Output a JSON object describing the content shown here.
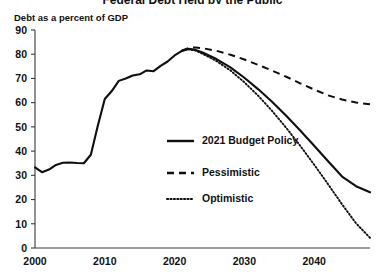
{
  "chart_data": {
    "type": "line",
    "title": "Federal Debt Held by the Public",
    "ylabel": "Debt as a percent of GDP",
    "xlabel": "",
    "xlim": [
      2000,
      2048
    ],
    "ylim": [
      0,
      90
    ],
    "yticks": [
      0,
      10,
      20,
      30,
      40,
      50,
      60,
      70,
      80,
      90
    ],
    "xticks": [
      2000,
      2010,
      2020,
      2030,
      2040
    ],
    "grid": false,
    "legend_position": "center",
    "series": [
      {
        "name": "2021 Budget Policy",
        "style": "solid",
        "x": [
          2000,
          2001,
          2002,
          2003,
          2004,
          2005,
          2006,
          2007,
          2008,
          2009,
          2010,
          2011,
          2012,
          2013,
          2014,
          2015,
          2016,
          2017,
          2018,
          2019,
          2020,
          2021,
          2022,
          2023,
          2024,
          2026,
          2028,
          2030,
          2032,
          2034,
          2036,
          2038,
          2040,
          2042,
          2044,
          2046,
          2048
        ],
        "values": [
          33.3,
          31.3,
          32.4,
          34.3,
          35.2,
          35.3,
          35.1,
          35.0,
          38.5,
          50.5,
          61.5,
          64.8,
          69.0,
          70.0,
          71.2,
          71.7,
          73.3,
          73.0,
          75.2,
          77.0,
          79.5,
          81.3,
          82.2,
          81.8,
          80.7,
          78.0,
          74.6,
          70.3,
          65.5,
          60.3,
          54.6,
          48.5,
          42.2,
          35.8,
          29.5,
          25.5,
          23.0
        ]
      },
      {
        "name": "Pessimistic",
        "style": "dashed",
        "x": [
          2021,
          2022,
          2023,
          2024,
          2026,
          2028,
          2030,
          2032,
          2034,
          2036,
          2038,
          2040,
          2042,
          2044,
          2046,
          2048
        ],
        "values": [
          81.5,
          82.6,
          82.8,
          82.5,
          81.4,
          79.8,
          77.8,
          75.6,
          73.2,
          70.7,
          68.0,
          65.4,
          63.0,
          61.3,
          60.1,
          59.3
        ]
      },
      {
        "name": "Optimistic",
        "style": "dotted",
        "x": [
          2021,
          2022,
          2023,
          2024,
          2026,
          2028,
          2030,
          2032,
          2034,
          2036,
          2038,
          2040,
          2042,
          2044,
          2046,
          2048
        ],
        "values": [
          81.3,
          82.1,
          81.5,
          80.2,
          77.2,
          73.3,
          68.4,
          62.8,
          56.5,
          49.6,
          42.2,
          34.4,
          26.3,
          18.0,
          10.2,
          4.2
        ]
      }
    ]
  },
  "legend": {
    "items": [
      {
        "label": "2021 Budget Policy",
        "style": "solid"
      },
      {
        "label": "Pessimistic",
        "style": "dashed"
      },
      {
        "label": "Optimistic",
        "style": "dotted"
      }
    ]
  },
  "colors": {
    "ink": "#0f0f0f",
    "axis": "#3a3a3a",
    "background": "#ffffff"
  }
}
